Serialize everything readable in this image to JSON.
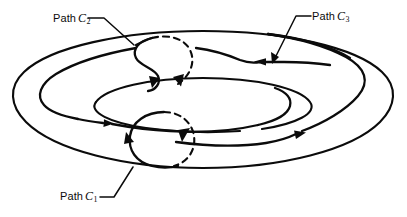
{
  "figure": {
    "background_color": "#ffffff",
    "ink_color": "#0b0b0b",
    "width": 407,
    "height": 217,
    "surface": "torus",
    "style": "line-art"
  },
  "labels": {
    "c1": {
      "prefix": "Path",
      "symbol": "C",
      "subscript": "1",
      "full_text": "Path C1"
    },
    "c2": {
      "prefix": "Path",
      "symbol": "C",
      "subscript": "2",
      "full_text": "Path C2"
    },
    "c3": {
      "prefix": "Path",
      "symbol": "C",
      "subscript": "3",
      "full_text": "Path C3"
    }
  },
  "paths": [
    {
      "id": "c1",
      "label": "Path C1",
      "description": "small loop encircling the tube at the bottom-center of the torus",
      "visible_segment": "solid front arc, dashed back arc",
      "arrow_count": 2,
      "orientation": "counterclockwise as drawn"
    },
    {
      "id": "c2",
      "label": "Path C2",
      "description": "loop encircling the tube at the top-center of the torus",
      "visible_segment": "solid front arc, dashed back arc",
      "arrow_count": 2,
      "orientation": "counterclockwise as drawn"
    },
    {
      "id": "c3",
      "label": "Path C3",
      "description": "long path winding around the central hole of the torus",
      "visible_segment": "solid",
      "arrow_count": 3,
      "orientation": "clockwise around the hole"
    }
  ],
  "annotations": {
    "leader_lines": 3,
    "arrowheads_total": 7,
    "dashed_arcs": 2
  }
}
